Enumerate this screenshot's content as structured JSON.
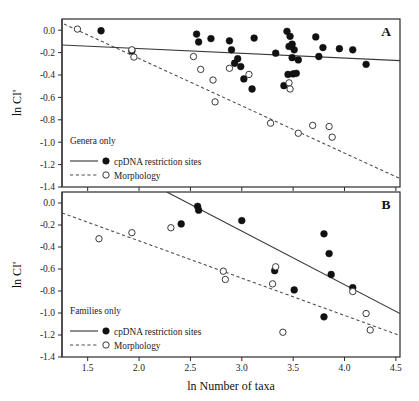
{
  "figure": {
    "xlabel": "ln Number of taxa",
    "ylabel": "ln CI'",
    "panel_a_letter": "A",
    "panel_b_letter": "B"
  },
  "legend": {
    "panel_a_title": "Genera only",
    "panel_b_title": "Families only",
    "series_solid_label": "cpDNA restriction sites",
    "series_dashed_label": "Morphology"
  },
  "axes": {
    "x_ticks": [
      "1.5",
      "2.0",
      "2.5",
      "3.0",
      "3.5",
      "4.0",
      "4.5"
    ],
    "y_ticks": [
      "0.0",
      "-0.2",
      "-0.4",
      "-0.6",
      "-0.8",
      "-1.0",
      "-1.2",
      "-1.4"
    ],
    "xlim": [
      1.25,
      4.54
    ],
    "ylim": [
      -1.4,
      0.1
    ]
  },
  "colors": {
    "filled_marker": "#111111",
    "open_marker_stroke": "#3a3a3a",
    "solid_fit": "#3a3a3a",
    "dashed_fit": "#4a4a4a",
    "frame": "#2b2b2b"
  },
  "chart_data": [
    {
      "type": "scatter",
      "panel": "A",
      "title": "Genera only",
      "xlabel": "ln Number of taxa",
      "ylabel": "ln CI'",
      "xlim": [
        1.25,
        4.54
      ],
      "ylim": [
        -1.4,
        0.1
      ],
      "grid": false,
      "legend_position": "bottom-left",
      "series": [
        {
          "name": "cpDNA restriction sites",
          "marker": "filled-circle",
          "fit": "solid",
          "points": [
            [
              1.63,
              -0.005
            ],
            [
              1.93,
              -0.185
            ],
            [
              2.56,
              -0.035
            ],
            [
              2.58,
              -0.105
            ],
            [
              2.7,
              -0.075
            ],
            [
              2.88,
              -0.095
            ],
            [
              2.9,
              -0.175
            ],
            [
              2.93,
              -0.295
            ],
            [
              2.96,
              -0.255
            ],
            [
              2.99,
              -0.325
            ],
            [
              3.02,
              -0.435
            ],
            [
              3.1,
              -0.525
            ],
            [
              3.12,
              -0.07
            ],
            [
              3.33,
              -0.205
            ],
            [
              3.44,
              -0.01
            ],
            [
              3.46,
              -0.145
            ],
            [
              3.47,
              -0.055
            ],
            [
              3.49,
              -0.125
            ],
            [
              3.51,
              -0.175
            ],
            [
              3.49,
              -0.245
            ],
            [
              3.55,
              -0.265
            ],
            [
              3.45,
              -0.395
            ],
            [
              3.5,
              -0.39
            ],
            [
              3.53,
              -0.385
            ],
            [
              3.41,
              -0.495
            ],
            [
              3.72,
              -0.06
            ],
            [
              3.75,
              -0.235
            ],
            [
              3.79,
              -0.155
            ],
            [
              3.95,
              -0.165
            ],
            [
              4.08,
              -0.175
            ],
            [
              4.21,
              -0.305
            ]
          ],
          "fit_line": {
            "x1": 1.25,
            "y1": -0.132,
            "x2": 4.54,
            "y2": -0.272
          }
        },
        {
          "name": "Morphology",
          "marker": "open-circle",
          "fit": "dashed",
          "points": [
            [
              1.4,
              0.01
            ],
            [
              1.93,
              -0.175
            ],
            [
              1.95,
              -0.24
            ],
            [
              2.53,
              -0.235
            ],
            [
              2.6,
              -0.35
            ],
            [
              2.72,
              -0.445
            ],
            [
              2.74,
              -0.64
            ],
            [
              2.88,
              -0.34
            ],
            [
              3.07,
              -0.395
            ],
            [
              3.28,
              -0.83
            ],
            [
              3.46,
              -0.47
            ],
            [
              3.47,
              -0.525
            ],
            [
              3.55,
              -0.92
            ],
            [
              3.69,
              -0.85
            ],
            [
              3.85,
              -0.86
            ],
            [
              3.88,
              -0.955
            ]
          ],
          "fit_line": {
            "x1": 1.27,
            "y1": 0.055,
            "x2": 4.54,
            "y2": -1.325
          }
        }
      ]
    },
    {
      "type": "scatter",
      "panel": "B",
      "title": "Families only",
      "xlabel": "ln Number of taxa",
      "ylabel": "ln CI'",
      "xlim": [
        1.25,
        4.54
      ],
      "ylim": [
        -1.4,
        0.1
      ],
      "grid": false,
      "legend_position": "bottom-left",
      "series": [
        {
          "name": "cpDNA restriction sites",
          "marker": "filled-circle",
          "fit": "solid",
          "points": [
            [
              2.41,
              -0.19
            ],
            [
              2.57,
              -0.03
            ],
            [
              2.58,
              -0.065
            ],
            [
              3.0,
              -0.16
            ],
            [
              3.32,
              -0.615
            ],
            [
              3.51,
              -0.79
            ],
            [
              3.8,
              -0.28
            ],
            [
              3.8,
              -1.035
            ],
            [
              3.85,
              -0.46
            ],
            [
              3.87,
              -0.65
            ],
            [
              4.08,
              -0.77
            ]
          ],
          "fit_line": {
            "x1": 2.27,
            "y1": 0.1,
            "x2": 4.54,
            "y2": -1.005
          }
        },
        {
          "name": "Morphology",
          "marker": "open-circle",
          "fit": "dashed",
          "points": [
            [
              1.61,
              -0.325
            ],
            [
              1.93,
              -0.27
            ],
            [
              2.31,
              -0.225
            ],
            [
              2.82,
              -0.62
            ],
            [
              2.84,
              -0.695
            ],
            [
              3.3,
              -0.735
            ],
            [
              3.33,
              -0.58
            ],
            [
              3.4,
              -1.175
            ],
            [
              4.08,
              -0.805
            ],
            [
              4.21,
              -1.005
            ],
            [
              4.25,
              -1.155
            ]
          ],
          "fit_line": {
            "x1": 1.25,
            "y1": -0.09,
            "x2": 4.54,
            "y2": -1.205
          }
        }
      ]
    }
  ]
}
